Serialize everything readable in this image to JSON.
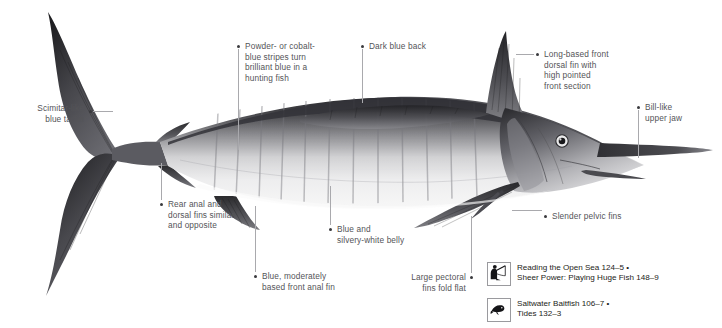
{
  "diagram": {
    "annotations": [
      {
        "id": "scimitar-tailfin",
        "text": "Scimitar-like\nblue tailfin",
        "align": "right",
        "x": 4,
        "y": 103,
        "w": 80,
        "dot": {
          "x": 89,
          "y": 110
        },
        "leader": {
          "type": "h",
          "x1": 93,
          "x2": 113,
          "y": 111
        }
      },
      {
        "id": "powder-cobalt-stripes",
        "text": "Powder- or cobalt-\nblue stripes turn\nbrilliant blue in a\nhunting fish",
        "align": "left",
        "x": 245,
        "y": 41,
        "w": 110,
        "dot": {
          "x": 237,
          "y": 45
        },
        "leader": {
          "type": "v",
          "x": 238,
          "y1": 49,
          "y2": 150
        }
      },
      {
        "id": "dark-blue-back",
        "text": "Dark blue back",
        "align": "left",
        "x": 369,
        "y": 41,
        "w": 90,
        "dot": {
          "x": 361,
          "y": 45
        },
        "leader": {
          "type": "v",
          "x": 362,
          "y1": 49,
          "y2": 103
        }
      },
      {
        "id": "long-based-front-dorsal-fin",
        "text": "Long-based front\ndorsal fin with\nhigh pointed\nfront section",
        "align": "left",
        "x": 544,
        "y": 49,
        "w": 100,
        "dot": {
          "x": 536,
          "y": 53
        },
        "leader": {
          "type": "h",
          "x1": 516,
          "x2": 534,
          "y": 54
        }
      },
      {
        "id": "bill-like-upper-jaw",
        "text": "Bill-like\nupper jaw",
        "align": "left",
        "x": 645,
        "y": 102,
        "w": 70,
        "dot": {
          "x": 637,
          "y": 106
        },
        "leader": {
          "type": "v",
          "x": 638,
          "y1": 110,
          "y2": 158
        }
      },
      {
        "id": "rear-anal-dorsal-fins",
        "text": "Rear anal and\ndorsal fins similar\nand opposite",
        "align": "left",
        "x": 168,
        "y": 199,
        "w": 100,
        "dot": {
          "x": 160,
          "y": 203
        },
        "leader": {
          "type": "v",
          "x": 161,
          "y1": 163,
          "y2": 200
        }
      },
      {
        "id": "blue-moderately-based-front-anal-fin",
        "text": "Blue, moderately\nbased front anal fin",
        "align": "left",
        "x": 262,
        "y": 271,
        "w": 110,
        "dot": {
          "x": 254,
          "y": 275
        },
        "leader": {
          "type": "v",
          "x": 255,
          "y1": 206,
          "y2": 272
        }
      },
      {
        "id": "blue-silvery-white-belly",
        "text": "Blue and\nsilvery-white belly",
        "align": "left",
        "x": 337,
        "y": 224,
        "w": 100,
        "dot": {
          "x": 329,
          "y": 228
        },
        "leader": {
          "type": "v",
          "x": 330,
          "y1": 186,
          "y2": 225
        }
      },
      {
        "id": "large-pectoral-fins-fold-flat",
        "text": "Large pectoral\nfins fold flat",
        "align": "right",
        "x": 380,
        "y": 272,
        "w": 86,
        "dot": {
          "x": 470,
          "y": 276
        },
        "leader": {
          "type": "v",
          "x": 471,
          "y1": 216,
          "y2": 273
        }
      },
      {
        "id": "slender-pelvic-fins",
        "text": "Slender pelvic fins",
        "align": "left",
        "x": 552,
        "y": 211,
        "w": 110,
        "dot": {
          "x": 544,
          "y": 215
        },
        "leader": {
          "type": "h",
          "x1": 512,
          "x2": 542,
          "y": 210
        }
      }
    ],
    "cross_references": [
      {
        "id": "xref-angler",
        "icon": "angler-rod-icon",
        "x": 487,
        "y": 262,
        "lines": "Reading the Open Sea 124–5 •\nSheer Power: Playing Huge Fish 148–9"
      },
      {
        "id": "xref-baitfish",
        "icon": "baitfish-icon",
        "x": 487,
        "y": 298,
        "lines": "Saltwater Baitfish 106–7 •\nTides 132–3"
      }
    ]
  },
  "colors": {
    "background": "#ffffff",
    "annotation_text": "#545458",
    "xref_text": "#1d1d20",
    "leader_line": "#a9a9ad",
    "bullet": "#3a3a3d",
    "fish_dark": "#2b2b2e",
    "fish_mid": "#6e6e72",
    "fish_light": "#d8d8da"
  }
}
